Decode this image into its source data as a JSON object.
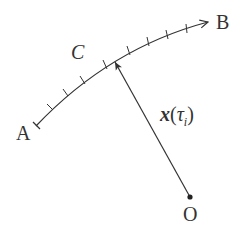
{
  "diagram": {
    "type": "parametric-curve-with-position-vector",
    "labels": {
      "start_point": "A",
      "end_point": "B",
      "curve": "C",
      "origin": "O",
      "vector_symbol": "x",
      "vector_arg_open": "(",
      "vector_arg_tau": "τ",
      "vector_arg_sub": "i",
      "vector_arg_close": ")"
    },
    "curve": {
      "start": [
        36,
        126
      ],
      "control": [
        110,
        48
      ],
      "end": [
        208,
        22
      ],
      "tick_count": 9,
      "has_arrowhead": true
    },
    "vector": {
      "from_origin": [
        190,
        197
      ],
      "to_curve_point": [
        114,
        60
      ],
      "has_arrowhead": true,
      "origin_marker": "dot"
    },
    "colors": {
      "stroke": "#333333",
      "text": "#333333",
      "background": "#ffffff"
    }
  }
}
